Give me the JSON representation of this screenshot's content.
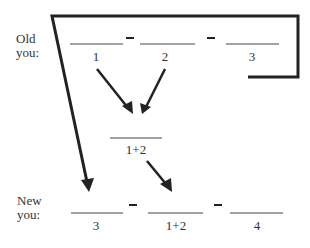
{
  "rows": {
    "old": {
      "label_line1": "Old",
      "label_line2": "you:",
      "slots": [
        "1",
        "2",
        "3"
      ],
      "operator": "–"
    },
    "middle": {
      "slot": "1+2"
    },
    "new": {
      "label_line1": "New",
      "label_line2": "you:",
      "slots": [
        "3",
        "1+2",
        "4"
      ],
      "operator": "–"
    }
  },
  "arrows": [
    {
      "from": "old slot 1",
      "to": "middle"
    },
    {
      "from": "old slot 2",
      "to": "middle"
    },
    {
      "from": "middle",
      "to": "new slot 2"
    },
    {
      "from": "old slot 3 (via bracket)",
      "to": "new slot 1"
    }
  ],
  "colors": {
    "ink": "#222222",
    "background": "#ffffff"
  }
}
